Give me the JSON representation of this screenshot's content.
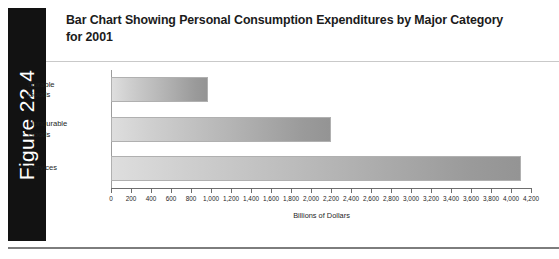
{
  "figure": {
    "tab_label": "Figure 22.4",
    "title": "Bar Chart Showing Personal Consumption Expenditures by Major Category for 2001",
    "tab_background": "#121212",
    "tab_text_color": "#ffffff"
  },
  "chart_data": {
    "type": "bar",
    "orientation": "horizontal",
    "title": "Bar Chart Showing Personal Consumption Expenditures by Major Category for 2001",
    "categories": [
      "Durable\nGoods",
      "Nondurable\nGoods",
      "Services"
    ],
    "values": [
      970,
      2200,
      4100
    ],
    "xlabel": "Billions of Dollars",
    "ylabel": "",
    "xlim": [
      0,
      4200
    ],
    "xtick_step": 200,
    "xticks": [
      0,
      200,
      400,
      600,
      800,
      1000,
      1200,
      1400,
      1600,
      1800,
      2000,
      2200,
      2400,
      2600,
      2800,
      3000,
      3200,
      3400,
      3600,
      3800,
      4000,
      4200
    ],
    "xtick_labels": [
      "0",
      "200",
      "400",
      "600",
      "800",
      "1,000",
      "1,200",
      "1,400",
      "1,600",
      "1,800",
      "2,000",
      "2,200",
      "2,400",
      "2,600",
      "2,800",
      "3,000",
      "3,200",
      "3,400",
      "3,600",
      "3,800",
      "4,000",
      "4,200"
    ],
    "grid": false,
    "legend": false,
    "bar_fill_start": "#dedede",
    "bar_fill_end": "#949494",
    "bar_border": "#b0b0b0"
  }
}
